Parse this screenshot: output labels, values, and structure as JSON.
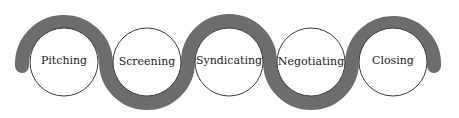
{
  "diagram": {
    "type": "process-flow",
    "band_color": "#6d6d6d",
    "stages": [
      {
        "label": "Pitching"
      },
      {
        "label": "Screening"
      },
      {
        "label": "Syndicating"
      },
      {
        "label": "Negotiating"
      },
      {
        "label": "Closing"
      }
    ]
  }
}
